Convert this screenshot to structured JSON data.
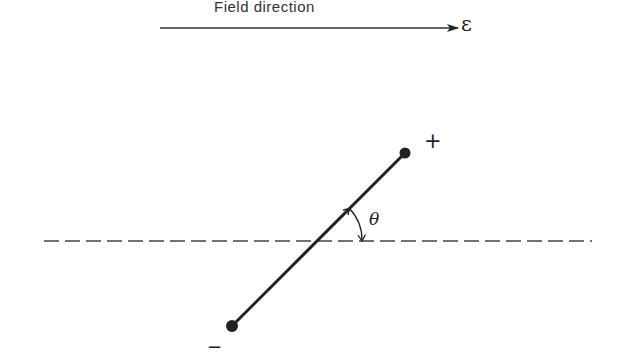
{
  "diagram": {
    "title": "Field direction",
    "field_symbol": "ε",
    "positive_label": "+",
    "negative_label": "−",
    "angle_label": "θ",
    "elements": {
      "field_arrow": {
        "x1": 160,
        "y1": 28,
        "x2": 458,
        "y2": 28
      },
      "reference_line": {
        "x1": 44,
        "y1": 241,
        "x2": 592,
        "y2": 241,
        "style": "dashed"
      },
      "dipole_axis": {
        "x1": 232,
        "y1": 326,
        "x2": 405,
        "y2": 153
      },
      "positive_charge": {
        "cx": 405,
        "cy": 153
      },
      "negative_charge": {
        "cx": 232,
        "cy": 326
      }
    },
    "colors": {
      "line": "#222222",
      "background": "#ffffff"
    }
  }
}
